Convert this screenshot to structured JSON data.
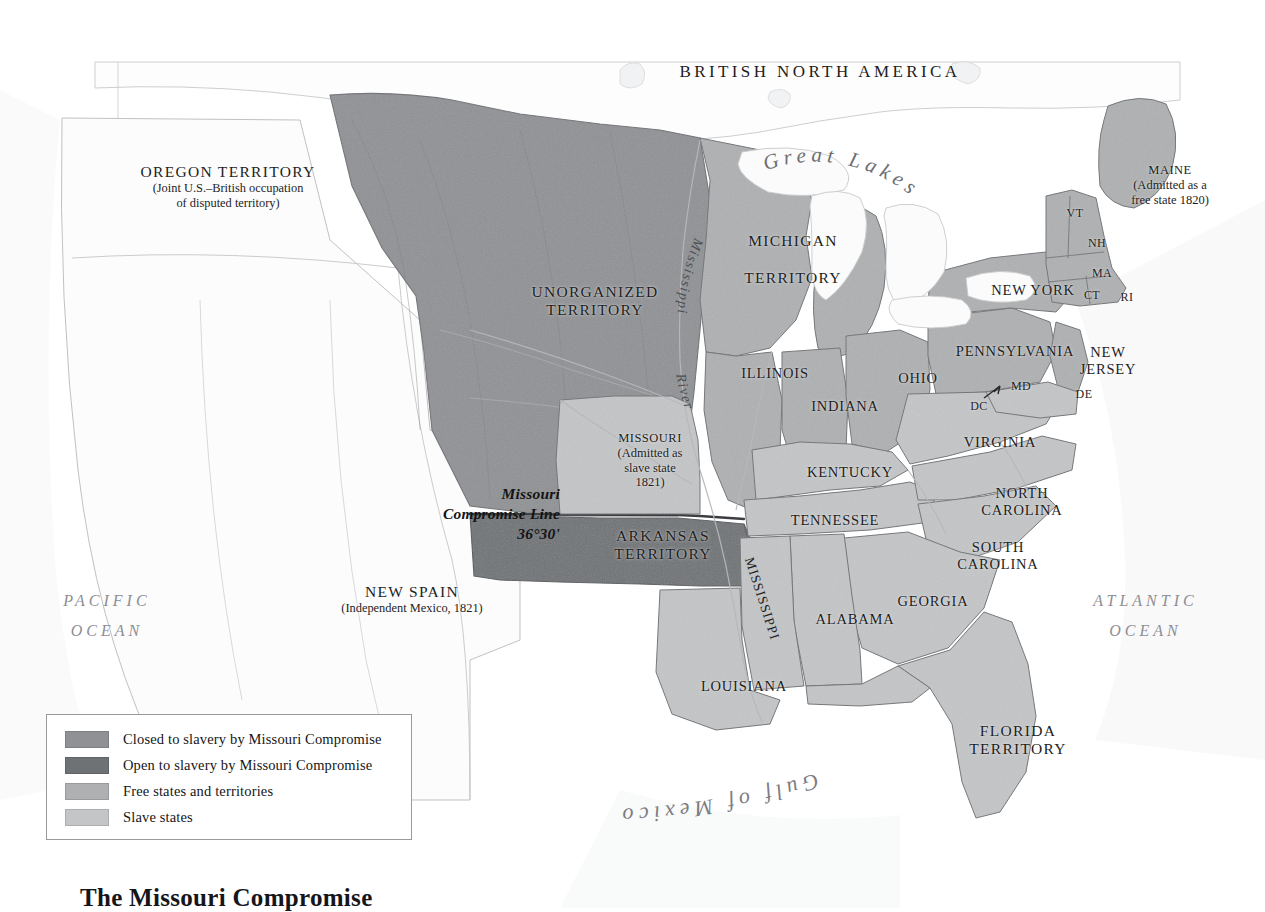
{
  "title": "The Missouri Compromise",
  "colors": {
    "closed": "#8f9194",
    "open": "#6f7275",
    "free": "#aeb0b2",
    "slave": "#c3c5c7",
    "unclaimed": "#fbfbfb",
    "water": "#ffffff",
    "border": "#6e7073",
    "ocean_text": "#8e8e93"
  },
  "header": {
    "british_north_america": "BRITISH NORTH AMERICA"
  },
  "regions": [
    {
      "id": "oregon-territory",
      "name": "OREGON TERRITORY",
      "note": "(Joint U.S.–British occupation\nof disputed territory)",
      "x": 123,
      "y": 163,
      "w": 210
    },
    {
      "id": "unorganized-territory",
      "name": "UNORGANIZED\nTERRITORY",
      "note": "",
      "x": 495,
      "y": 283,
      "w": 200
    },
    {
      "id": "michigan-territory",
      "name": "MICHIGAN\n\nTERRITORY",
      "note": "",
      "x": 703,
      "y": 232,
      "w": 180
    },
    {
      "id": "arkansas-territory",
      "name": "ARKANSAS\nTERRITORY",
      "note": "",
      "x": 578,
      "y": 527,
      "w": 170
    },
    {
      "id": "florida-territory",
      "name": "FLORIDA\nTERRITORY",
      "note": "",
      "x": 943,
      "y": 722,
      "w": 150
    },
    {
      "id": "new-spain",
      "name": "NEW SPAIN",
      "note": "(Independent Mexico, 1821)",
      "x": 300,
      "y": 583,
      "w": 224
    }
  ],
  "annotated_states": [
    {
      "id": "missouri",
      "name": "MISSOURI",
      "note": "(Admitted as\nslave state\n1821)",
      "x": 585,
      "y": 431,
      "w": 130
    },
    {
      "id": "maine",
      "name": "MAINE",
      "note": "(Admitted as a\nfree state 1820)",
      "x": 1095,
      "y": 163,
      "w": 150
    }
  ],
  "states": [
    {
      "id": "illinois",
      "label": "ILLINOIS",
      "x": 720,
      "y": 365,
      "w": 110
    },
    {
      "id": "indiana",
      "label": "INDIANA",
      "x": 790,
      "y": 398,
      "w": 110
    },
    {
      "id": "ohio",
      "label": "OHIO",
      "x": 868,
      "y": 370,
      "w": 100
    },
    {
      "id": "kentucky",
      "label": "KENTUCKY",
      "x": 790,
      "y": 464,
      "w": 120
    },
    {
      "id": "tennessee",
      "label": "TENNESSEE",
      "x": 772,
      "y": 512,
      "w": 126
    },
    {
      "id": "virginia",
      "label": "VIRGINIA",
      "x": 940,
      "y": 434,
      "w": 120
    },
    {
      "id": "north-carolina",
      "label": "NORTH\nCAROLINA",
      "x": 962,
      "y": 485,
      "w": 120
    },
    {
      "id": "south-carolina",
      "label": "SOUTH\nCAROLINA",
      "x": 938,
      "y": 539,
      "w": 120
    },
    {
      "id": "georgia",
      "label": "GEORGIA",
      "x": 878,
      "y": 593,
      "w": 110
    },
    {
      "id": "alabama",
      "label": "ALABAMA",
      "x": 800,
      "y": 611,
      "w": 110
    },
    {
      "id": "louisiana",
      "label": "LOUISIANA",
      "x": 684,
      "y": 678,
      "w": 120
    },
    {
      "id": "new-york",
      "label": "NEW YORK",
      "x": 973,
      "y": 282,
      "w": 120
    },
    {
      "id": "pennsylvania",
      "label": "PENNSYLVANIA",
      "x": 940,
      "y": 343,
      "w": 150
    },
    {
      "id": "new-jersey",
      "label": "NEW\nJERSEY",
      "x": 1068,
      "y": 344,
      "w": 80
    },
    {
      "id": "vermont",
      "label": "VT",
      "x": 1058,
      "y": 206,
      "w": 34
    },
    {
      "id": "new-hampshire",
      "label": "NH",
      "x": 1080,
      "y": 236,
      "w": 34
    },
    {
      "id": "massachusetts",
      "label": "MA",
      "x": 1085,
      "y": 266,
      "w": 34
    },
    {
      "id": "connecticut",
      "label": "CT",
      "x": 1077,
      "y": 288,
      "w": 30
    },
    {
      "id": "rhode-island",
      "label": "RI",
      "x": 1113,
      "y": 290,
      "w": 28
    },
    {
      "id": "maryland",
      "label": "MD",
      "x": 1004,
      "y": 379,
      "w": 34
    },
    {
      "id": "delaware",
      "label": "DE",
      "x": 1069,
      "y": 387,
      "w": 30
    },
    {
      "id": "dc",
      "label": "DC",
      "x": 963,
      "y": 399,
      "w": 32
    }
  ],
  "rotated_states": [
    {
      "id": "mississippi-state",
      "label": "MISSISSIPPI",
      "x": 758,
      "y": 600,
      "rot": 72
    }
  ],
  "water_labels": [
    {
      "id": "pacific-ocean",
      "label": "PACIFIC\nOCEAN",
      "x": 22,
      "y": 586,
      "w": 170
    },
    {
      "id": "atlantic-ocean",
      "label": "ATLANTIC\nOCEAN",
      "x": 1058,
      "y": 586,
      "w": 175
    }
  ],
  "curved_water": {
    "great_lakes": "Great Lakes",
    "gulf_of_mexico": "Gulf of Mexico",
    "mississippi_river": "Mississippi",
    "river": "River"
  },
  "compromise_line": {
    "label": "Missouri\nCompromise Line\n36°30'",
    "latitude": "36°30'",
    "x": 400,
    "y": 484,
    "w": 160
  },
  "legend": {
    "items": [
      {
        "id": "legend-closed",
        "label": "Closed to slavery by Missouri Compromise",
        "color": "#8f9194"
      },
      {
        "id": "legend-open",
        "label": "Open to slavery by Missouri Compromise",
        "color": "#6f7275"
      },
      {
        "id": "legend-free",
        "label": "Free states and territories",
        "color": "#aeb0b2"
      },
      {
        "id": "legend-slave",
        "label": "Slave states",
        "color": "#c3c5c7"
      }
    ]
  },
  "chart_data": {
    "type": "map",
    "title": "The Missouri Compromise",
    "projection": "United States, 1820",
    "categories": [
      "Closed to slavery by Missouri Compromise",
      "Open to slavery by Missouri Compromise",
      "Free states and territories",
      "Slave states"
    ],
    "features": [
      {
        "name": "Unorganized Territory",
        "category": "Closed to slavery by Missouri Compromise"
      },
      {
        "name": "Arkansas Territory",
        "category": "Open to slavery by Missouri Compromise"
      },
      {
        "name": "Michigan Territory",
        "category": "Free states and territories"
      },
      {
        "name": "Illinois",
        "category": "Free states and territories"
      },
      {
        "name": "Indiana",
        "category": "Free states and territories"
      },
      {
        "name": "Ohio",
        "category": "Free states and territories"
      },
      {
        "name": "New York",
        "category": "Free states and territories"
      },
      {
        "name": "Pennsylvania",
        "category": "Free states and territories"
      },
      {
        "name": "New Jersey",
        "category": "Free states and territories"
      },
      {
        "name": "Vermont",
        "category": "Free states and territories"
      },
      {
        "name": "New Hampshire",
        "category": "Free states and territories"
      },
      {
        "name": "Massachusetts",
        "category": "Free states and territories"
      },
      {
        "name": "Connecticut",
        "category": "Free states and territories"
      },
      {
        "name": "Rhode Island",
        "category": "Free states and territories"
      },
      {
        "name": "Maine",
        "category": "Free states and territories"
      },
      {
        "name": "Missouri",
        "category": "Slave states"
      },
      {
        "name": "Kentucky",
        "category": "Slave states"
      },
      {
        "name": "Tennessee",
        "category": "Slave states"
      },
      {
        "name": "Virginia",
        "category": "Slave states"
      },
      {
        "name": "North Carolina",
        "category": "Slave states"
      },
      {
        "name": "South Carolina",
        "category": "Slave states"
      },
      {
        "name": "Georgia",
        "category": "Slave states"
      },
      {
        "name": "Alabama",
        "category": "Slave states"
      },
      {
        "name": "Mississippi",
        "category": "Slave states"
      },
      {
        "name": "Louisiana",
        "category": "Slave states"
      },
      {
        "name": "Maryland",
        "category": "Slave states"
      },
      {
        "name": "Delaware",
        "category": "Slave states"
      },
      {
        "name": "Florida Territory",
        "category": "Slave states"
      }
    ],
    "annotations": [
      "Missouri Compromise Line 36°30'",
      "MAINE (Admitted as a free state 1820)",
      "MISSOURI (Admitted as slave state 1821)",
      "OREGON TERRITORY (Joint U.S.–British occupation of disputed territory)",
      "NEW SPAIN (Independent Mexico, 1821)",
      "BRITISH NORTH AMERICA"
    ]
  }
}
